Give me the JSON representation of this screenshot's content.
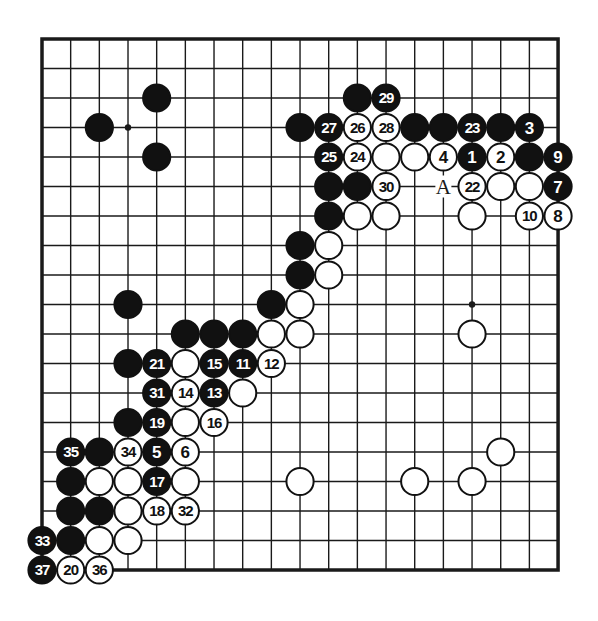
{
  "diagram": {
    "type": "go-board-diagram",
    "board_size": 19,
    "colors": {
      "line": "#1a1a1a",
      "black_stone": "#111111",
      "white_stone": "#ffffff",
      "background": "#ffffff"
    },
    "star_points": [
      [
        3,
        3
      ],
      [
        15,
        9
      ]
    ],
    "labels": [
      {
        "col": 14,
        "row": 5,
        "text": "A"
      }
    ],
    "stones": [
      {
        "col": 4,
        "row": 2,
        "color": "black",
        "num": ""
      },
      {
        "col": 2,
        "row": 3,
        "color": "black",
        "num": ""
      },
      {
        "col": 4,
        "row": 4,
        "color": "black",
        "num": ""
      },
      {
        "col": 11,
        "row": 2,
        "color": "black",
        "num": ""
      },
      {
        "col": 12,
        "row": 2,
        "color": "black",
        "num": "29"
      },
      {
        "col": 9,
        "row": 3,
        "color": "black",
        "num": ""
      },
      {
        "col": 10,
        "row": 3,
        "color": "black",
        "num": "27"
      },
      {
        "col": 11,
        "row": 3,
        "color": "white",
        "num": "26"
      },
      {
        "col": 12,
        "row": 3,
        "color": "white",
        "num": "28"
      },
      {
        "col": 13,
        "row": 3,
        "color": "black",
        "num": ""
      },
      {
        "col": 14,
        "row": 3,
        "color": "black",
        "num": ""
      },
      {
        "col": 15,
        "row": 3,
        "color": "black",
        "num": "23"
      },
      {
        "col": 16,
        "row": 3,
        "color": "black",
        "num": ""
      },
      {
        "col": 17,
        "row": 3,
        "color": "black",
        "num": "3"
      },
      {
        "col": 10,
        "row": 4,
        "color": "black",
        "num": "25"
      },
      {
        "col": 11,
        "row": 4,
        "color": "white",
        "num": "24"
      },
      {
        "col": 12,
        "row": 4,
        "color": "white",
        "num": ""
      },
      {
        "col": 13,
        "row": 4,
        "color": "white",
        "num": ""
      },
      {
        "col": 14,
        "row": 4,
        "color": "white",
        "num": "4"
      },
      {
        "col": 15,
        "row": 4,
        "color": "black",
        "num": "1"
      },
      {
        "col": 16,
        "row": 4,
        "color": "white",
        "num": "2"
      },
      {
        "col": 17,
        "row": 4,
        "color": "black",
        "num": ""
      },
      {
        "col": 18,
        "row": 4,
        "color": "black",
        "num": "9"
      },
      {
        "col": 10,
        "row": 5,
        "color": "black",
        "num": ""
      },
      {
        "col": 11,
        "row": 5,
        "color": "black",
        "num": ""
      },
      {
        "col": 12,
        "row": 5,
        "color": "white",
        "num": "30"
      },
      {
        "col": 15,
        "row": 5,
        "color": "white",
        "num": "22"
      },
      {
        "col": 16,
        "row": 5,
        "color": "white",
        "num": ""
      },
      {
        "col": 17,
        "row": 5,
        "color": "white",
        "num": ""
      },
      {
        "col": 18,
        "row": 5,
        "color": "black",
        "num": "7"
      },
      {
        "col": 10,
        "row": 6,
        "color": "black",
        "num": ""
      },
      {
        "col": 11,
        "row": 6,
        "color": "white",
        "num": ""
      },
      {
        "col": 12,
        "row": 6,
        "color": "white",
        "num": ""
      },
      {
        "col": 15,
        "row": 6,
        "color": "white",
        "num": ""
      },
      {
        "col": 17,
        "row": 6,
        "color": "white",
        "num": "10"
      },
      {
        "col": 18,
        "row": 6,
        "color": "white",
        "num": "8"
      },
      {
        "col": 9,
        "row": 7,
        "color": "black",
        "num": ""
      },
      {
        "col": 10,
        "row": 7,
        "color": "white",
        "num": ""
      },
      {
        "col": 9,
        "row": 8,
        "color": "black",
        "num": ""
      },
      {
        "col": 10,
        "row": 8,
        "color": "white",
        "num": ""
      },
      {
        "col": 3,
        "row": 9,
        "color": "black",
        "num": ""
      },
      {
        "col": 8,
        "row": 9,
        "color": "black",
        "num": ""
      },
      {
        "col": 9,
        "row": 9,
        "color": "white",
        "num": ""
      },
      {
        "col": 5,
        "row": 10,
        "color": "black",
        "num": ""
      },
      {
        "col": 6,
        "row": 10,
        "color": "black",
        "num": ""
      },
      {
        "col": 7,
        "row": 10,
        "color": "black",
        "num": ""
      },
      {
        "col": 8,
        "row": 10,
        "color": "white",
        "num": ""
      },
      {
        "col": 9,
        "row": 10,
        "color": "white",
        "num": ""
      },
      {
        "col": 15,
        "row": 10,
        "color": "white",
        "num": ""
      },
      {
        "col": 3,
        "row": 11,
        "color": "black",
        "num": ""
      },
      {
        "col": 4,
        "row": 11,
        "color": "black",
        "num": "21"
      },
      {
        "col": 5,
        "row": 11,
        "color": "white",
        "num": ""
      },
      {
        "col": 6,
        "row": 11,
        "color": "black",
        "num": "15"
      },
      {
        "col": 7,
        "row": 11,
        "color": "black",
        "num": "11"
      },
      {
        "col": 8,
        "row": 11,
        "color": "white",
        "num": "12"
      },
      {
        "col": 4,
        "row": 12,
        "color": "black",
        "num": "31"
      },
      {
        "col": 5,
        "row": 12,
        "color": "white",
        "num": "14"
      },
      {
        "col": 6,
        "row": 12,
        "color": "black",
        "num": "13"
      },
      {
        "col": 7,
        "row": 12,
        "color": "white",
        "num": ""
      },
      {
        "col": 3,
        "row": 13,
        "color": "black",
        "num": ""
      },
      {
        "col": 4,
        "row": 13,
        "color": "black",
        "num": "19"
      },
      {
        "col": 5,
        "row": 13,
        "color": "white",
        "num": ""
      },
      {
        "col": 6,
        "row": 13,
        "color": "white",
        "num": "16"
      },
      {
        "col": 1,
        "row": 14,
        "color": "black",
        "num": "35"
      },
      {
        "col": 2,
        "row": 14,
        "color": "black",
        "num": ""
      },
      {
        "col": 3,
        "row": 14,
        "color": "white",
        "num": "34"
      },
      {
        "col": 4,
        "row": 14,
        "color": "black",
        "num": "5"
      },
      {
        "col": 5,
        "row": 14,
        "color": "white",
        "num": "6"
      },
      {
        "col": 16,
        "row": 14,
        "color": "white",
        "num": ""
      },
      {
        "col": 1,
        "row": 15,
        "color": "black",
        "num": ""
      },
      {
        "col": 2,
        "row": 15,
        "color": "white",
        "num": ""
      },
      {
        "col": 3,
        "row": 15,
        "color": "white",
        "num": ""
      },
      {
        "col": 4,
        "row": 15,
        "color": "black",
        "num": "17"
      },
      {
        "col": 5,
        "row": 15,
        "color": "white",
        "num": ""
      },
      {
        "col": 9,
        "row": 15,
        "color": "white",
        "num": ""
      },
      {
        "col": 13,
        "row": 15,
        "color": "white",
        "num": ""
      },
      {
        "col": 15,
        "row": 15,
        "color": "white",
        "num": ""
      },
      {
        "col": 1,
        "row": 16,
        "color": "black",
        "num": ""
      },
      {
        "col": 2,
        "row": 16,
        "color": "black",
        "num": ""
      },
      {
        "col": 3,
        "row": 16,
        "color": "white",
        "num": ""
      },
      {
        "col": 4,
        "row": 16,
        "color": "white",
        "num": "18"
      },
      {
        "col": 5,
        "row": 16,
        "color": "white",
        "num": "32"
      },
      {
        "col": 0,
        "row": 17,
        "color": "black",
        "num": "33"
      },
      {
        "col": 1,
        "row": 17,
        "color": "black",
        "num": ""
      },
      {
        "col": 2,
        "row": 17,
        "color": "white",
        "num": ""
      },
      {
        "col": 3,
        "row": 17,
        "color": "white",
        "num": ""
      },
      {
        "col": 0,
        "row": 18,
        "color": "black",
        "num": "37"
      },
      {
        "col": 1,
        "row": 18,
        "color": "white",
        "num": "20"
      },
      {
        "col": 2,
        "row": 18,
        "color": "white",
        "num": "36"
      }
    ]
  }
}
